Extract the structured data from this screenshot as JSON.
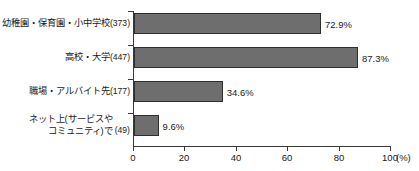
{
  "chart_data": {
    "type": "bar",
    "orientation": "horizontal",
    "title": "",
    "subtitle": "",
    "xlabel": "(%)",
    "ylabel": "",
    "xlim": [
      0,
      100
    ],
    "grid": false,
    "legend": null,
    "axis_unit": "(%)",
    "categories": [
      "幼稚園・保育園・小中学校",
      "高校・大学",
      "職場・アルバイト先",
      "ネット上(サービスやコミュニティ)で"
    ],
    "category_lines": [
      [
        "幼稚園・保育園・小中学校"
      ],
      [
        "高校・大学"
      ],
      [
        "職場・アルバイト先"
      ],
      [
        "ネット上(サービスや",
        "コミュニティ)で"
      ]
    ],
    "counts": [
      373,
      447,
      177,
      49
    ],
    "count_labels": [
      "(373)",
      "(447)",
      "(177)",
      "(49)"
    ],
    "values": [
      72.9,
      87.3,
      34.6,
      9.6
    ],
    "value_labels": [
      "72.9%",
      "87.3%",
      "34.6%",
      "9.6%"
    ],
    "xticks": [
      0,
      20,
      40,
      60,
      80,
      100
    ],
    "xtick_labels": [
      "0",
      "20",
      "40",
      "60",
      "80",
      "100"
    ],
    "bar_color": "#6e6e6e",
    "bar_border_color": "#2e2e2e",
    "axis_color": "#3a3a3a",
    "text_color": "#1a1a1a",
    "background_color": "#ffffff"
  }
}
